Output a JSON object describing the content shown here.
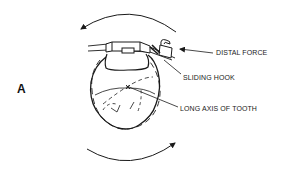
{
  "figure": {
    "panel_letter": "A",
    "labels": {
      "distal_force": "DISTAL FORCE",
      "sliding_hook": "SLIDING HOOK",
      "long_axis": "LONG AXIS OF TOOTH"
    },
    "colors": {
      "line": "#1a1a1a",
      "background": "#ffffff"
    }
  }
}
